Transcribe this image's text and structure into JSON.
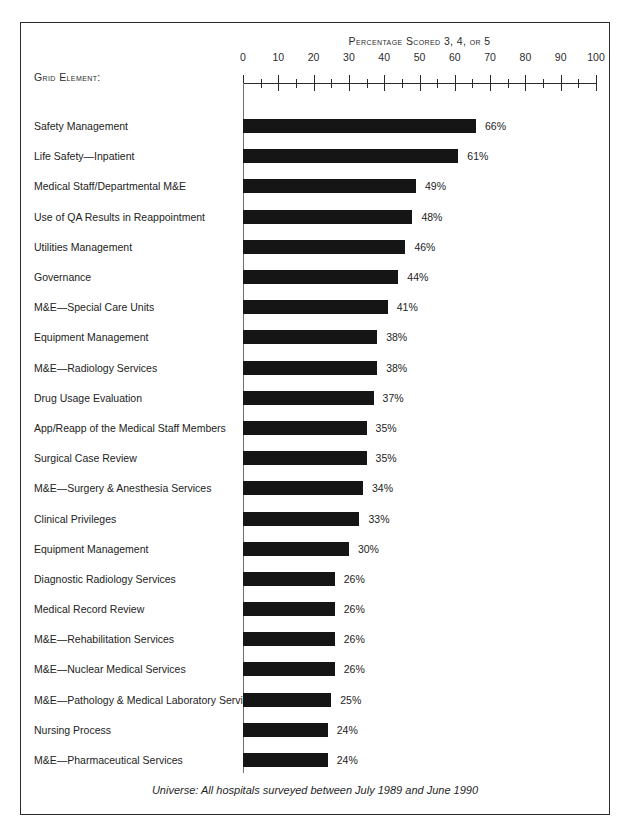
{
  "frame": {
    "axis_title": "Percentage Scored 3, 4, or 5",
    "row_header": "Grid Element:",
    "universe_note": "Universe: All hospitals surveyed between July 1989 and June 1990"
  },
  "style": {
    "bar_color": "#151515",
    "axis_color": "#2b2b2b",
    "frame_color": "#2b2b2b",
    "background": "#ffffff"
  },
  "chart_data": {
    "type": "bar",
    "orientation": "horizontal",
    "title": "Percentage Scored 3, 4, or 5",
    "xlabel": "Percentage Scored 3, 4, or 5",
    "ylabel": "Grid Element:",
    "xlim": [
      0,
      100
    ],
    "grid": false,
    "legend": false,
    "major_tick_step": 10,
    "minor_tick_step": 5,
    "tick_labels": [
      "0",
      "10",
      "20",
      "30",
      "40",
      "50",
      "60",
      "70",
      "80",
      "90",
      "100"
    ],
    "value_suffix": "%",
    "categories": [
      "Safety Management",
      "Life Safety—Inpatient",
      "Medical Staff/Departmental M&E",
      "Use of QA Results in Reappointment",
      "Utilities Management",
      "Governance",
      "M&E—Special Care Units",
      "Equipment Management",
      "M&E—Radiology Services",
      "Drug Usage Evaluation",
      "App/Reapp of the Medical Staff Members",
      "Surgical Case Review",
      "M&E—Surgery & Anesthesia Services",
      "Clinical Privileges",
      "Equipment Management",
      "Diagnostic Radiology Services",
      "Medical Record Review",
      "M&E—Rehabilitation Services",
      "M&E—Nuclear Medical Services",
      "M&E—Pathology & Medical Laboratory Services",
      "Nursing Process",
      "M&E—Pharmaceutical Services"
    ],
    "values": [
      66,
      61,
      49,
      48,
      46,
      44,
      41,
      38,
      38,
      37,
      35,
      35,
      34,
      33,
      30,
      26,
      26,
      26,
      26,
      25,
      24,
      24
    ],
    "value_labels": [
      "66%",
      "61%",
      "49%",
      "48%",
      "46%",
      "44%",
      "41%",
      "38%",
      "38%",
      "37%",
      "35%",
      "35%",
      "34%",
      "33%",
      "30%",
      "26%",
      "26%",
      "26%",
      "26%",
      "25%",
      "24%",
      "24%"
    ]
  }
}
